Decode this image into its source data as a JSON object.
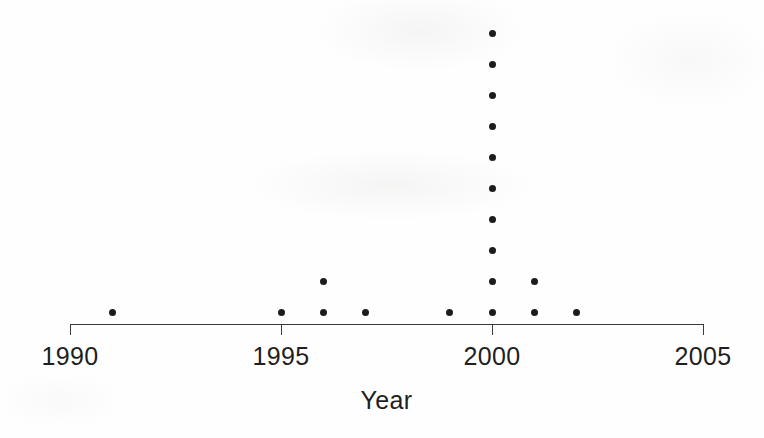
{
  "figure": {
    "width": 764,
    "height": 438,
    "background_color": "#fefefe",
    "ink_color": "#1c1c1c",
    "axis_color": "#3a3a3a"
  },
  "axis": {
    "title": "Year",
    "tick_labels": [
      "1990",
      "1995",
      "2000",
      "2005"
    ],
    "tick_values": [
      1990,
      1995,
      2000,
      2005
    ],
    "range_min": 1990,
    "range_max": 2005,
    "baseline_y": 324,
    "left_x": 70,
    "right_x": 703,
    "tick_length": 11
  },
  "dots": {
    "radius_px": 3.5,
    "row_spacing_px": 31,
    "first_row_y": 312
  },
  "chart_data": {
    "type": "scatter",
    "title": "",
    "subtitle": "",
    "xlabel": "Year",
    "ylabel": "",
    "xlim": [
      1990,
      2005
    ],
    "ylim": [
      0,
      10
    ],
    "grid": false,
    "legend": null,
    "annotations": [],
    "xtick_labels": [
      "1990",
      "1995",
      "2000",
      "2005"
    ],
    "xticks": [
      1990,
      1995,
      2000,
      2005
    ],
    "categories": [
      1991,
      1995,
      1996,
      1997,
      1999,
      2000,
      2001,
      2002
    ],
    "values": [
      1,
      1,
      2,
      1,
      1,
      10,
      2,
      1
    ],
    "total_observations": 19,
    "points": [
      {
        "x": 1991,
        "stack": 1
      },
      {
        "x": 1995,
        "stack": 1
      },
      {
        "x": 1996,
        "stack": 2
      },
      {
        "x": 1997,
        "stack": 1
      },
      {
        "x": 1999,
        "stack": 1
      },
      {
        "x": 2000,
        "stack": 10
      },
      {
        "x": 2001,
        "stack": 2
      },
      {
        "x": 2002,
        "stack": 1
      }
    ]
  }
}
